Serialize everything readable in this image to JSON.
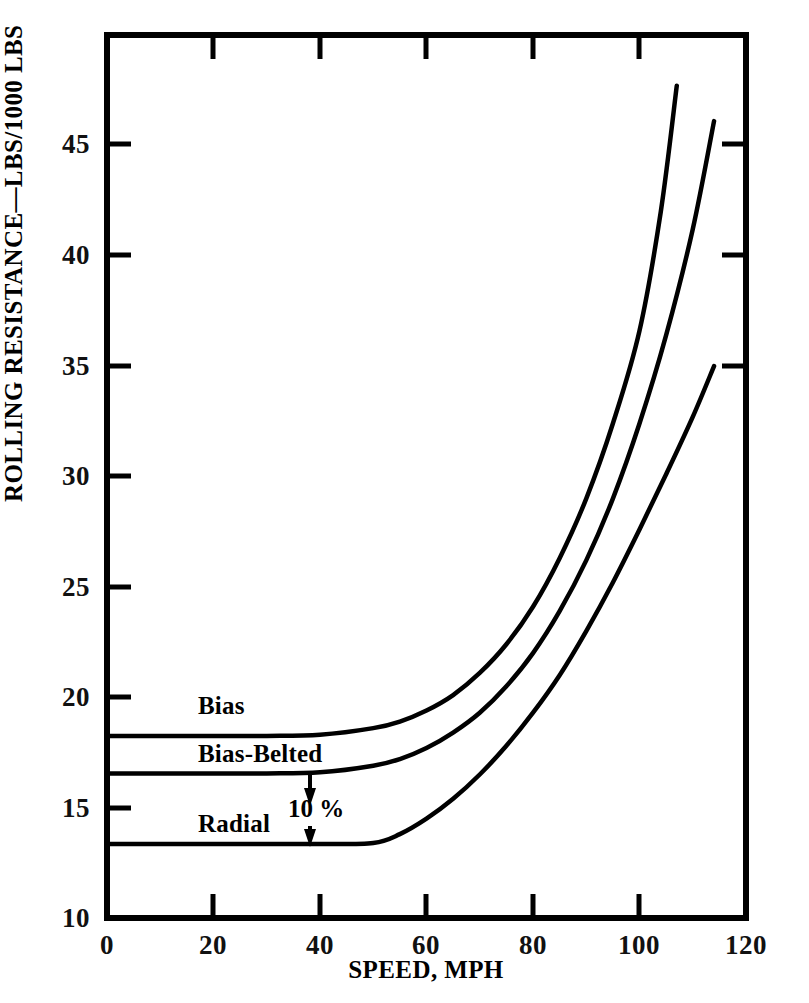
{
  "chart_data": {
    "type": "line",
    "title": "",
    "xlabel": "SPEED, MPH",
    "ylabel": "ROLLING RESISTANCE—LBS/1000 LBS",
    "xlim": [
      0,
      120
    ],
    "ylim": [
      10,
      50
    ],
    "xticks": [
      0,
      20,
      40,
      60,
      80,
      100,
      120
    ],
    "xtick_labels": [
      "0",
      "20",
      "40",
      "60",
      "80",
      "100",
      "120"
    ],
    "yticks": [
      10,
      15,
      20,
      25,
      30,
      35,
      40,
      45
    ],
    "ytick_labels": [
      "10",
      "15",
      "20",
      "25",
      "30",
      "35",
      "40",
      "45"
    ],
    "grid": false,
    "legend": "inline-curve-labels",
    "series": [
      {
        "name": "Bias",
        "label_x": 22,
        "label_y": 19.2,
        "x": [
          0,
          10,
          20,
          30,
          40,
          50,
          55,
          60,
          65,
          70,
          75,
          80,
          85,
          90,
          95,
          100,
          104,
          107
        ],
        "y": [
          18.25,
          18.25,
          18.25,
          18.25,
          18.3,
          18.6,
          18.9,
          19.4,
          20.1,
          21.1,
          22.4,
          24.1,
          26.3,
          29.0,
          32.4,
          36.6,
          42.0,
          47.7
        ]
      },
      {
        "name": "Bias-Belted",
        "label_x": 22,
        "label_y": 17.5,
        "x": [
          0,
          10,
          20,
          30,
          40,
          50,
          55,
          60,
          65,
          70,
          75,
          80,
          85,
          90,
          95,
          100,
          105,
          110,
          114
        ],
        "y": [
          16.55,
          16.55,
          16.55,
          16.55,
          16.6,
          16.9,
          17.2,
          17.7,
          18.4,
          19.3,
          20.5,
          22.0,
          23.9,
          26.2,
          29.0,
          32.4,
          36.4,
          41.2,
          46.1
        ]
      },
      {
        "name": "Radial",
        "label_x": 22,
        "label_y": 14.2,
        "x": [
          0,
          10,
          20,
          30,
          40,
          50,
          55,
          60,
          65,
          70,
          75,
          80,
          85,
          90,
          95,
          100,
          105,
          110,
          114
        ],
        "y": [
          13.35,
          13.35,
          13.35,
          13.35,
          13.35,
          13.4,
          13.8,
          14.5,
          15.4,
          16.5,
          17.8,
          19.3,
          21.0,
          23.0,
          25.2,
          27.6,
          30.1,
          32.7,
          35.0
        ]
      }
    ],
    "annotations": [
      {
        "name": "ten-percent-gap",
        "text": "10 %",
        "x": 38,
        "y_top": 16.55,
        "y_bottom": 13.35,
        "label_x": 40,
        "label_y": 14.9,
        "arrow": "double-headed-vertical"
      }
    ]
  },
  "axes": {
    "frame_color": "#000000",
    "line_color": "#000000",
    "background": "#ffffff"
  }
}
